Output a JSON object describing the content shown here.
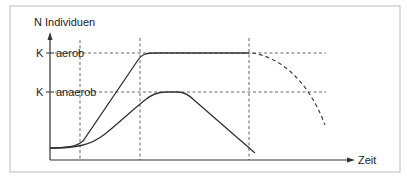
{
  "diagram": {
    "y_axis_label": "N Individuen",
    "x_axis_label": "Zeit",
    "levels": [
      {
        "symbol": "K",
        "label": "aerob"
      },
      {
        "symbol": "K",
        "label": "anaerob"
      }
    ],
    "curves": [
      {
        "name": "aerob",
        "description": "sigmoid growth to K aerob, plateau, then dashed decline"
      },
      {
        "name": "anaerob",
        "description": "slower growth to K anaerob, short plateau, then decline"
      }
    ],
    "colors": {
      "line": "#333333",
      "dashed": "#555555",
      "border": "#bbbbbb"
    }
  }
}
